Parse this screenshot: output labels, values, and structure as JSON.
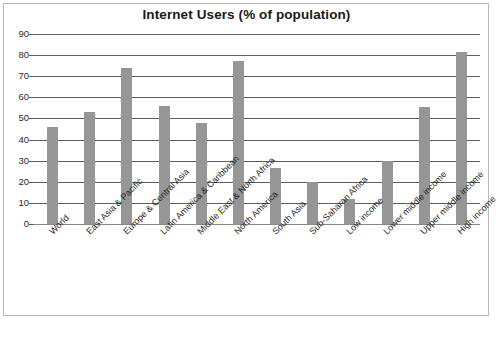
{
  "chart_data": {
    "type": "bar",
    "title": "Internet Users (% of population)",
    "xlabel": "",
    "ylabel": "",
    "ylim": [
      0,
      90
    ],
    "ytick_step": 10,
    "yticks": [
      90,
      80,
      70,
      60,
      50,
      40,
      30,
      20,
      10,
      0
    ],
    "grid": true,
    "legend": "none",
    "bar_color": "#969696",
    "gridline_color": "#5e5e5e",
    "frame_color": "#b9b9b9",
    "categories": [
      "World",
      "East Asia & Pacific",
      "Europe & Central Asia",
      "Latin America & Caribbean",
      "Middle East & North Africa",
      "North America",
      "South Asia",
      "Sub-Saharan Africa",
      "Low income",
      "Lower middle income",
      "Upper middle income",
      "High income"
    ],
    "values": [
      46,
      53,
      74,
      56,
      48,
      77,
      26.5,
      20,
      12,
      30,
      55.5,
      81.5
    ]
  },
  "caption": {
    "text": ""
  }
}
